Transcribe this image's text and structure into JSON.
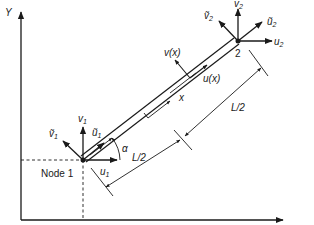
{
  "diagram": {
    "colors": {
      "line": "#1a1a1a",
      "background": "#ffffff"
    },
    "axes": {
      "y_label": "Y"
    },
    "node1": {
      "label": "Node 1",
      "dofs": {
        "u": "u",
        "u_sub": "1",
        "v": "v",
        "v_sub": "1",
        "u_tilde": "ũ",
        "u_tilde_sub": "1",
        "v_tilde": "ṽ",
        "v_tilde_sub": "1"
      }
    },
    "node2": {
      "label": "2",
      "dofs": {
        "u": "u",
        "u_sub": "2",
        "v": "v",
        "v_sub": "2",
        "u_tilde": "ũ",
        "u_tilde_sub": "2",
        "v_tilde": "ṽ",
        "v_tilde_sub": "2"
      }
    },
    "angle_label": "α",
    "local": {
      "x_label": "x",
      "u_label": "u(x)",
      "v_label": "v(x)"
    },
    "dimensions": {
      "half_length_1": "L/2",
      "half_length_2": "L/2"
    }
  }
}
